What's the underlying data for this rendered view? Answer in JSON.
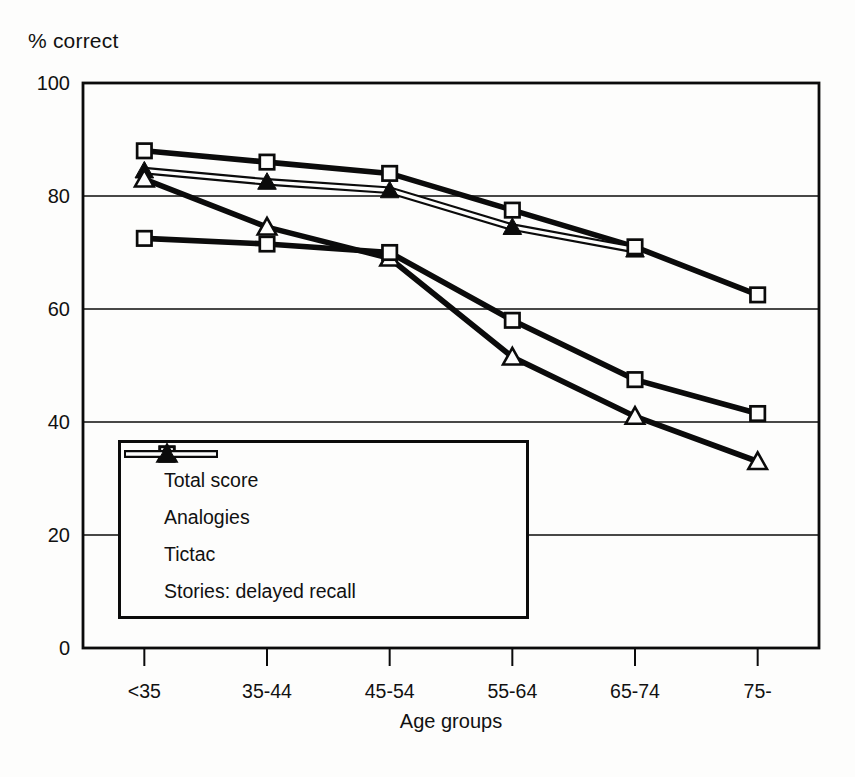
{
  "figure": {
    "y_axis_title": "% correct",
    "x_axis_title": "Age groups"
  },
  "chart_data": {
    "type": "line",
    "title": "% correct",
    "xlabel": "Age groups",
    "ylabel": "",
    "categories": [
      "<35",
      "35-44",
      "45-54",
      "55-64",
      "65-74",
      "75-"
    ],
    "series": [
      {
        "name": "Total score",
        "marker": "open-square",
        "line": "thick",
        "values": [
          88,
          86,
          84,
          77.5,
          71,
          62.5
        ]
      },
      {
        "name": "Analogies",
        "marker": "open-square",
        "line": "thick",
        "values": [
          72.5,
          71.5,
          70,
          58,
          47.5,
          41.5
        ]
      },
      {
        "name": "Tictac",
        "marker": "open-triangle",
        "line": "thick",
        "values": [
          83,
          74.5,
          69,
          51.5,
          41,
          33
        ]
      },
      {
        "name": "Stories: delayed recall",
        "marker": "filled-triangle",
        "line": "double",
        "values": [
          84.5,
          82.5,
          81,
          74.5,
          70.5,
          null
        ]
      }
    ],
    "ylim": [
      0,
      100
    ],
    "yticks": [
      0,
      20,
      40,
      60,
      80,
      100
    ],
    "grid": "horizontal",
    "legend_position": "inside-lower-left",
    "legend_entries": [
      "Total score",
      "Analogies",
      "Tictac",
      "Stories: delayed recall"
    ]
  },
  "colors": {
    "ink": "#0b0b0b",
    "paper": "#fdfdfc"
  }
}
